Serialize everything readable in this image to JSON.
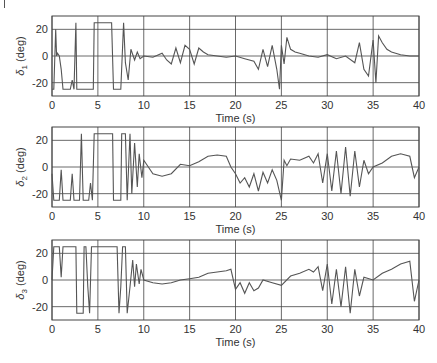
{
  "chart_data": [
    {
      "type": "line",
      "title": "",
      "xlabel": "Time (s)",
      "ylabel": "δ1 (deg)",
      "ylabel_main": "δ",
      "ylabel_sub": "1",
      "ylabel_unit": " (deg)",
      "xlim": [
        0,
        40
      ],
      "ylim": [
        -30,
        30
      ],
      "xticks": [
        0,
        5,
        10,
        15,
        20,
        25,
        30,
        35,
        40
      ],
      "yticks": [
        -20,
        0,
        20
      ],
      "grid": true,
      "series": [
        {
          "name": "delta1",
          "x": [
            0,
            0.2,
            0.4,
            0.5,
            0.6,
            0.8,
            1.0,
            1.2,
            1.4,
            1.6,
            2.0,
            2.2,
            2.4,
            2.6,
            2.7,
            2.8,
            3.0,
            4.0,
            4.5,
            4.6,
            6.5,
            6.7,
            7.5,
            7.8,
            8.0,
            8.3,
            8.6,
            9.0,
            9.3,
            9.6,
            10,
            11,
            12,
            12.5,
            13,
            13.5,
            14,
            14.5,
            15,
            15.5,
            16,
            16.5,
            17,
            18,
            19,
            20,
            21,
            22,
            22.5,
            23,
            23.5,
            24,
            24.5,
            24.8,
            25,
            25.3,
            25.6,
            26,
            26.5,
            27,
            28,
            29,
            30,
            31,
            32,
            33,
            33.5,
            34,
            34.5,
            35,
            35.3,
            35.6,
            36,
            36.5,
            37,
            38,
            39,
            40
          ],
          "y": [
            -25,
            -25,
            20,
            0,
            2,
            0,
            -10,
            -25,
            -25,
            -25,
            -25,
            -18,
            -25,
            25,
            -25,
            -25,
            -25,
            -25,
            -25,
            25,
            25,
            -25,
            -25,
            25,
            -5,
            -18,
            5,
            -3,
            3,
            -2,
            0,
            -1,
            2,
            -3,
            -6,
            6,
            -5,
            8,
            5,
            -6,
            6,
            3,
            1,
            0,
            -1,
            0,
            -2,
            -4,
            -10,
            5,
            -8,
            8,
            -10,
            -25,
            8,
            -6,
            14,
            5,
            3,
            2,
            0,
            -1,
            1,
            -2,
            0,
            -5,
            10,
            -10,
            -15,
            12,
            -20,
            15,
            10,
            5,
            3,
            1,
            0,
            0
          ]
        },
        {
          "name": "delta2",
          "x": [
            0,
            0.2,
            0.5,
            0.8,
            1.0,
            1.2,
            1.5,
            2.0,
            2.2,
            2.4,
            2.6,
            3.0,
            3.2,
            3.4,
            3.6,
            4.0,
            4.2,
            4.4,
            4.6,
            6.6,
            6.7,
            7.5,
            7.6,
            8.0,
            8.2,
            8.5,
            8.7,
            9.0,
            9.3,
            9.5,
            9.8,
            10,
            11,
            12,
            13,
            14,
            15,
            16,
            17,
            18,
            19,
            19.5,
            20,
            20.5,
            21,
            21.5,
            22,
            22.5,
            23,
            23.5,
            24,
            24.5,
            25,
            25.3,
            25.6,
            26,
            27,
            28,
            28.5,
            29,
            29.5,
            30,
            30.5,
            31,
            31.5,
            32,
            32.5,
            33,
            33.5,
            34,
            34.5,
            35,
            36,
            37,
            38,
            39,
            39.5,
            40
          ],
          "y": [
            -5,
            -25,
            -25,
            -25,
            -2,
            -25,
            -25,
            -25,
            -5,
            -25,
            -25,
            -25,
            25,
            -25,
            -25,
            -25,
            -12,
            -25,
            25,
            25,
            -25,
            -25,
            25,
            25,
            -25,
            25,
            -20,
            18,
            -15,
            10,
            -8,
            5,
            -5,
            -7,
            -5,
            2,
            1,
            4,
            8,
            9,
            8,
            0,
            -5,
            -12,
            -8,
            -15,
            -5,
            -18,
            -4,
            -12,
            -2,
            -10,
            -25,
            5,
            1,
            6,
            5,
            8,
            3,
            10,
            -12,
            10,
            -18,
            12,
            -20,
            15,
            -22,
            12,
            -15,
            5,
            -5,
            0,
            3,
            8,
            10,
            8,
            -8,
            0
          ]
        },
        {
          "name": "delta3",
          "x": [
            0,
            0.2,
            0.4,
            0.6,
            0.8,
            1.0,
            1.2,
            1.4,
            2.6,
            2.7,
            3.4,
            3.5,
            3.7,
            3.9,
            4.1,
            4.3,
            4.5,
            7.1,
            7.3,
            7.5,
            7.7,
            8.0,
            8.2,
            8.5,
            8.8,
            9.0,
            9.2,
            9.5,
            9.7,
            10,
            11,
            12,
            13,
            14,
            15,
            16,
            17,
            18,
            19,
            19.5,
            20,
            20.5,
            21,
            21.5,
            22,
            22.5,
            23,
            24,
            25,
            26,
            27,
            28,
            28.5,
            29,
            29.5,
            30,
            30.5,
            31,
            31.5,
            32,
            32.5,
            33,
            33.5,
            34,
            35,
            36,
            37,
            38,
            39,
            39.5,
            40
          ],
          "y": [
            0,
            25,
            25,
            25,
            25,
            2,
            25,
            25,
            25,
            -25,
            -25,
            25,
            25,
            -5,
            -25,
            25,
            25,
            25,
            -25,
            -5,
            25,
            25,
            -25,
            -5,
            15,
            -5,
            12,
            -3,
            8,
            0,
            -2,
            -3,
            -2,
            0,
            1,
            2,
            5,
            6,
            7,
            8,
            -7,
            -2,
            -10,
            -2,
            -8,
            -6,
            0,
            -2,
            -4,
            3,
            5,
            8,
            6,
            10,
            -8,
            12,
            -18,
            8,
            -20,
            10,
            -25,
            8,
            -12,
            2,
            0,
            5,
            8,
            12,
            14,
            -16,
            0
          ]
        }
      ]
    }
  ],
  "panels": [
    {
      "ylabel_main": "δ",
      "ylabel_sub": "1",
      "ylabel_unit": " (deg)",
      "xlabel": "Time (s)"
    },
    {
      "ylabel_main": "δ",
      "ylabel_sub": "2",
      "ylabel_unit": " (deg)",
      "xlabel": "Time (s)"
    },
    {
      "ylabel_main": "δ",
      "ylabel_sub": "3",
      "ylabel_unit": " (deg)",
      "xlabel": "Time (s)"
    }
  ],
  "ticks": {
    "x": [
      "0",
      "5",
      "10",
      "15",
      "20",
      "25",
      "30",
      "35",
      "40"
    ],
    "y": [
      "20",
      "0",
      "-20"
    ]
  }
}
